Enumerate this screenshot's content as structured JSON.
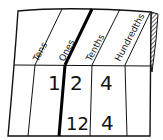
{
  "diagram": {
    "type": "place-value-chart",
    "headers": [
      "Tens",
      "Ones",
      "Tenths",
      "Hundredths"
    ],
    "rows": [
      {
        "tens": "",
        "ones": "1",
        "tenths": "2",
        "hundredths": "4"
      },
      {
        "tens": "",
        "ones": "",
        "tenths": "12",
        "hundredths": "4"
      }
    ],
    "decimal_point_marker": "thick line between Ones and Tenths"
  }
}
